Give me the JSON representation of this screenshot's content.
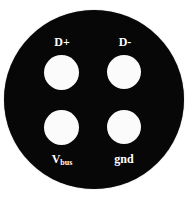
{
  "figure": {
    "background_color": "#ffffff",
    "body_color": "#070707",
    "hole_color": "#fbfbfb",
    "label_color": "#ffffff",
    "shape": "circle"
  },
  "pins": {
    "top_left": {
      "label": "D+",
      "label_main": "D+",
      "label_sub": "",
      "position": "top-left"
    },
    "top_right": {
      "label": "D-",
      "label_main": "D-",
      "label_sub": "",
      "position": "top-right"
    },
    "bottom_left": {
      "label": "Vbus",
      "label_main": "V",
      "label_sub": "bus",
      "position": "bottom-left"
    },
    "bottom_right": {
      "label": "gnd",
      "label_main": "gnd",
      "label_sub": "",
      "position": "bottom-right"
    }
  }
}
